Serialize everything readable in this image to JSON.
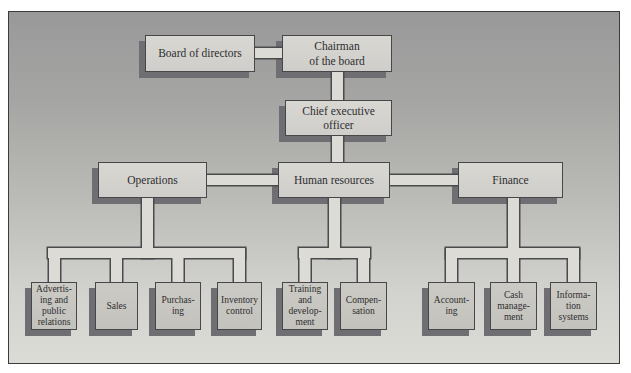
{
  "figure": {
    "type": "organization-chart"
  },
  "palette": {
    "background_top": "#99999a",
    "background_bottom": "#dcdcd7",
    "frame_border": "#3c3c3e",
    "box_fill_large": "#d3d2cd",
    "box_fill_small": "#c7c6c0",
    "box_border": "#47474a",
    "pipe_fill": "#dcdbd6",
    "pipe_outline": "#4a4a4c",
    "shadow": "#6f6f73",
    "text": "#2e2e30"
  },
  "nodes": {
    "board": {
      "label": "Board of directors"
    },
    "chairman": {
      "label": "Chairman\nof the board"
    },
    "ceo": {
      "label": "Chief executive\nofficer"
    },
    "operations": {
      "label": "Operations"
    },
    "human_resources": {
      "label": "Human resources"
    },
    "finance": {
      "label": "Finance"
    },
    "advertising": {
      "label": "Advertis-\ning and\npublic\nrelations"
    },
    "sales": {
      "label": "Sales"
    },
    "purchasing": {
      "label": "Purchas-\ning"
    },
    "inventory": {
      "label": "Inventory\ncontrol"
    },
    "training": {
      "label": "Training\nand\ndevelop-\nment"
    },
    "compensation": {
      "label": "Compen-\nsation"
    },
    "accounting": {
      "label": "Account-\ning"
    },
    "cash": {
      "label": "Cash\nmanage-\nment"
    },
    "information": {
      "label": "Informa-\ntion\nsystems"
    }
  },
  "edges": [
    [
      "board",
      "chairman"
    ],
    [
      "chairman",
      "ceo"
    ],
    [
      "ceo",
      "human_resources"
    ],
    [
      "operations",
      "human_resources"
    ],
    [
      "human_resources",
      "finance"
    ],
    [
      "operations",
      "advertising"
    ],
    [
      "operations",
      "sales"
    ],
    [
      "operations",
      "purchasing"
    ],
    [
      "operations",
      "inventory"
    ],
    [
      "human_resources",
      "training"
    ],
    [
      "human_resources",
      "compensation"
    ],
    [
      "finance",
      "accounting"
    ],
    [
      "finance",
      "cash"
    ],
    [
      "finance",
      "information"
    ]
  ]
}
